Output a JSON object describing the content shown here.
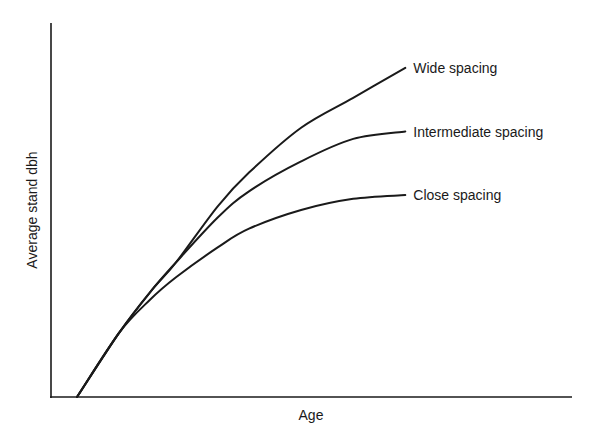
{
  "chart_data": {
    "type": "line",
    "title": "",
    "xlabel": "Age",
    "ylabel": "Average stand dbh",
    "xlim": [
      0,
      1
    ],
    "ylim": [
      0,
      1
    ],
    "grid": false,
    "ticks": "none",
    "legend": "direct labels at right end of each curve",
    "series": [
      {
        "name": "Wide spacing",
        "x": [
          0.05,
          0.13,
          0.19,
          0.24,
          0.32,
          0.38,
          0.48,
          0.58,
          0.68
        ],
        "y": [
          0.0,
          0.17,
          0.28,
          0.36,
          0.51,
          0.6,
          0.72,
          0.8,
          0.88
        ]
      },
      {
        "name": "Intermediate spacing",
        "x": [
          0.05,
          0.13,
          0.19,
          0.24,
          0.32,
          0.38,
          0.48,
          0.58,
          0.68
        ],
        "y": [
          0.0,
          0.17,
          0.28,
          0.36,
          0.48,
          0.55,
          0.63,
          0.69,
          0.71
        ]
      },
      {
        "name": "Close spacing",
        "x": [
          0.05,
          0.13,
          0.19,
          0.24,
          0.32,
          0.38,
          0.48,
          0.58,
          0.68
        ],
        "y": [
          0.0,
          0.17,
          0.26,
          0.32,
          0.4,
          0.45,
          0.5,
          0.53,
          0.54
        ]
      }
    ]
  }
}
